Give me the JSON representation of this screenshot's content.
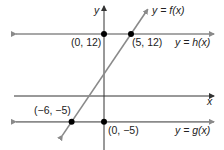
{
  "chart_data": {
    "type": "line",
    "title": "",
    "xlabel": "x",
    "ylabel": "y",
    "grid": false,
    "series": [
      {
        "name": "y = f(x)",
        "kind": "linear",
        "points": [
          [
            -6,
            -5
          ],
          [
            5,
            12
          ]
        ],
        "color": "#8a8a8a"
      },
      {
        "name": "y = h(x)",
        "kind": "constant",
        "value": 12,
        "color": "#8a8a8a"
      },
      {
        "name": "y = g(x)",
        "kind": "constant",
        "value": -5,
        "color": "#8a8a8a"
      }
    ],
    "labeled_points": [
      {
        "label": "(0, 12)",
        "x": 0,
        "y": 12
      },
      {
        "label": "(5, 12)",
        "x": 5,
        "y": 12
      },
      {
        "label": "(−6, −5)",
        "x": -6,
        "y": -5
      },
      {
        "label": "(0, −5)",
        "x": 0,
        "y": -5
      }
    ],
    "colors": {
      "axis": "#333333",
      "line": "#8a8a8a",
      "point": "#000000"
    }
  },
  "labels": {
    "y_axis": "y",
    "x_axis": "x",
    "f": "y = f(x)",
    "h": "y = h(x)",
    "g": "y = g(x)",
    "p1": "(0, 12)",
    "p2": "(5, 12)",
    "p3": "(−6, −5)",
    "p4": "(0, −5)"
  }
}
